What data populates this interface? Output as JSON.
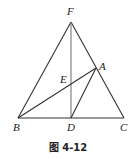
{
  "figure": {
    "caption": "图 4-12",
    "points": {
      "F": {
        "label": "F",
        "x": 71,
        "y": 22,
        "lx": 67,
        "ly": 15
      },
      "A": {
        "label": "A",
        "x": 96,
        "y": 68,
        "lx": 99,
        "ly": 69
      },
      "E": {
        "label": "E",
        "x": 71,
        "y": 84,
        "lx": 60,
        "ly": 82
      },
      "B": {
        "label": "B",
        "x": 18,
        "y": 118,
        "lx": 14,
        "ly": 131
      },
      "D": {
        "label": "D",
        "x": 71,
        "y": 118,
        "lx": 67,
        "ly": 131
      },
      "C": {
        "label": "C",
        "x": 124,
        "y": 118,
        "lx": 121,
        "ly": 131
      }
    },
    "segments": [
      [
        "F",
        "B"
      ],
      [
        "F",
        "C"
      ],
      [
        "F",
        "D"
      ],
      [
        "B",
        "C"
      ],
      [
        "B",
        "A"
      ],
      [
        "A",
        "D"
      ]
    ],
    "line_color": "#333333"
  }
}
